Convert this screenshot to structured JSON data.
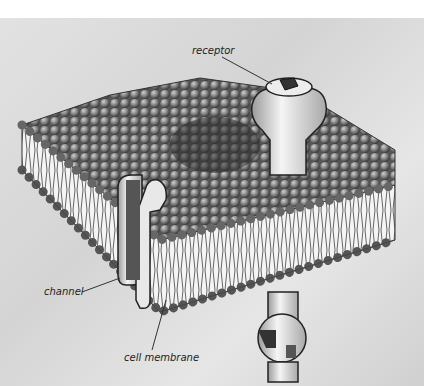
{
  "diagram": {
    "labels": [
      {
        "id": "receptor",
        "text": "receptor"
      },
      {
        "id": "channel",
        "text": "channel"
      },
      {
        "id": "cell_membrane",
        "text": "cell membrane"
      }
    ]
  }
}
